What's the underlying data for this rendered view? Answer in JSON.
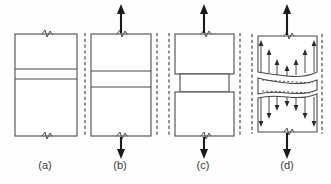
{
  "figure": {
    "background_color": "#fefefe",
    "outline_color": "#4a4a4a",
    "arrow_color": "#1a1a1a",
    "label_color": "#3a3a3a",
    "width": 331,
    "height": 184
  },
  "panels": [
    {
      "id": "a",
      "label": "(a)",
      "label_x": 45,
      "label_y": 169,
      "description": "Undeformed specimen with central band, no applied load",
      "has_reference_lines": false,
      "has_load_arrows": false,
      "has_stress_arrows": false,
      "has_necking": false,
      "body_left": 15,
      "body_right": 77,
      "body_top": 34,
      "body_bottom": 136,
      "band_top": 69,
      "band_bottom": 79,
      "break_marks": [
        "top",
        "bottom"
      ]
    },
    {
      "id": "b",
      "label": "(b)",
      "label_x": 120,
      "label_y": 169,
      "description": "Specimen under tensile load, reference lines straight, band elongated",
      "has_reference_lines": true,
      "has_load_arrows": true,
      "has_stress_arrows": false,
      "has_necking": false,
      "body_left": 91,
      "body_right": 151,
      "body_top": 34,
      "body_bottom": 136,
      "band_top": 71,
      "band_bottom": 87,
      "ref_left_x": 85,
      "ref_right_x": 157,
      "ref_top": 33,
      "ref_bottom": 137,
      "arrow_up_x": 121,
      "arrow_up_top": 5,
      "arrow_up_bottom": 33,
      "arrow_down_x": 121,
      "arrow_down_top": 137,
      "arrow_down_bottom": 159,
      "break_marks": [
        "top",
        "bottom"
      ]
    },
    {
      "id": "c",
      "label": "(c)",
      "label_x": 203,
      "label_y": 169,
      "description": "Specimen with necking, central band contracted laterally",
      "has_reference_lines": true,
      "has_load_arrows": true,
      "has_stress_arrows": false,
      "has_necking": true,
      "body_left": 175,
      "body_right": 234,
      "body_top": 34,
      "body_bottom": 136,
      "band_top": 74,
      "band_bottom": 92,
      "neck_inset": 5,
      "ref_left_x": 169,
      "ref_right_x": 240,
      "ref_top": 33,
      "ref_bottom": 137,
      "arrow_up_x": 204,
      "arrow_up_top": 5,
      "arrow_up_bottom": 33,
      "arrow_down_x": 204,
      "arrow_down_top": 137,
      "arrow_down_bottom": 159,
      "break_marks": [
        "top",
        "bottom"
      ]
    },
    {
      "id": "d",
      "label": "(d)",
      "label_x": 287,
      "label_y": 169,
      "description": "Internal stress distribution arrows, longest near edges, shortest near center",
      "has_reference_lines": true,
      "has_load_arrows": true,
      "has_stress_arrows": true,
      "has_necking": true,
      "body_left": 258,
      "body_right": 317,
      "body_top": 36,
      "body_bottom": 132,
      "band_top": 74,
      "band_bottom": 92,
      "neck_inset": 4,
      "ref_left_x": 252,
      "ref_right_x": 322,
      "ref_top": 34,
      "ref_bottom": 134,
      "arrow_up_x": 287,
      "arrow_up_top": 5,
      "arrow_up_bottom": 35,
      "arrow_down_x": 287,
      "arrow_down_top": 133,
      "arrow_down_bottom": 159,
      "break_marks": [
        "top",
        "bottom"
      ],
      "stress_profile_x": [
        261,
        269,
        277,
        287,
        296,
        305,
        314
      ],
      "stress_profile_length": [
        32,
        24,
        16,
        10,
        16,
        24,
        32
      ]
    }
  ],
  "stress_diagram": {
    "type": "vector-field",
    "upper_direction": "up",
    "lower_direction": "down",
    "note": "Arrow length represents local stress magnitude across the section"
  }
}
